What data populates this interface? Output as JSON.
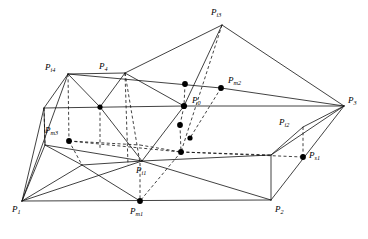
{
  "figure": {
    "type": "geometric-wireframe-diagram",
    "width": 368,
    "height": 239,
    "background_color": "#ffffff",
    "line_color": "#111111",
    "dot_color": "#000000"
  },
  "labels": [
    {
      "id": "P1",
      "base": "P",
      "sub": "1",
      "text": "P1",
      "x": 12,
      "y": 209
    },
    {
      "id": "P2",
      "base": "P",
      "sub": "2",
      "text": "P2",
      "x": 275,
      "y": 209
    },
    {
      "id": "P3",
      "base": "P",
      "sub": "3",
      "text": "P3",
      "x": 348,
      "y": 98
    },
    {
      "id": "P4",
      "base": "P",
      "sub": "4",
      "text": "P4",
      "x": 99,
      "y": 64
    },
    {
      "id": "Pi1",
      "base": "P",
      "sub": "i1",
      "text": "Pi1",
      "x": 136,
      "y": 169
    },
    {
      "id": "Pi2",
      "base": "P",
      "sub": "i2",
      "text": "Pi2",
      "x": 281,
      "y": 120
    },
    {
      "id": "Pi3",
      "base": "P",
      "sub": "i3",
      "text": "Pi3",
      "x": 211,
      "y": 10
    },
    {
      "id": "Pi4",
      "base": "P",
      "sub": "i4",
      "text": "Pi4",
      "x": 47,
      "y": 65
    },
    {
      "id": "Pm1",
      "base": "P",
      "sub": "m1",
      "text": "Pm1",
      "x": 131,
      "y": 211
    },
    {
      "id": "Pm2",
      "base": "P",
      "sub": "m2",
      "text": "Pm2",
      "x": 228,
      "y": 77
    },
    {
      "id": "Pm3",
      "base": "P",
      "sub": "m3",
      "text": "Pm3",
      "x": 46,
      "y": 128
    },
    {
      "id": "Ps1",
      "base": "P",
      "sub": "s1",
      "text": "Ps1",
      "x": 309,
      "y": 152
    },
    {
      "id": "P0",
      "base": "P",
      "sub": "0",
      "text": "P0",
      "x": 192,
      "y": 98
    }
  ],
  "vertices": {
    "P1": {
      "x": 22,
      "y": 201
    },
    "P2": {
      "x": 271,
      "y": 200
    },
    "P3": {
      "x": 344,
      "y": 106
    },
    "P4": {
      "x": 125,
      "y": 73
    },
    "Pi3": {
      "x": 222,
      "y": 25
    },
    "Pi4": {
      "x": 68,
      "y": 74
    },
    "Pi2": {
      "x": 303,
      "y": 127
    },
    "Pi1": {
      "x": 142,
      "y": 161
    },
    "P0": {
      "x": 184,
      "y": 106
    },
    "Pm1": {
      "x": 140,
      "y": 201
    },
    "Pm2": {
      "x": 221,
      "y": 88
    },
    "Pm3": {
      "x": 69,
      "y": 141
    },
    "Ps1": {
      "x": 303,
      "y": 157
    },
    "A": {
      "x": 44,
      "y": 108
    },
    "B": {
      "x": 100,
      "y": 107
    },
    "C": {
      "x": 45,
      "y": 145
    },
    "D": {
      "x": 185,
      "y": 84
    },
    "E": {
      "x": 184,
      "y": 125
    },
    "F": {
      "x": 190,
      "y": 138
    },
    "G": {
      "x": 182,
      "y": 152
    },
    "H": {
      "x": 82,
      "y": 165
    },
    "I": {
      "x": 140,
      "y": 163
    },
    "J": {
      "x": 271,
      "y": 155
    }
  },
  "marker_dots": [
    {
      "name": "dot-at-B",
      "x": 100,
      "y": 107,
      "r": 2.6
    },
    {
      "name": "dot-at-Pm3",
      "x": 69,
      "y": 141,
      "r": 2.9
    },
    {
      "name": "dot-at-Pm2",
      "x": 221,
      "y": 88,
      "r": 2.9
    },
    {
      "name": "dot-at-D",
      "x": 185,
      "y": 84,
      "r": 2.9
    },
    {
      "name": "dot-at-P0",
      "x": 184,
      "y": 106,
      "r": 3.1
    },
    {
      "name": "dot-at-E",
      "x": 180,
      "y": 125,
      "r": 2.9
    },
    {
      "name": "dot-at-F",
      "x": 190,
      "y": 138,
      "r": 2.6
    },
    {
      "name": "dot-at-G",
      "x": 181,
      "y": 152,
      "r": 2.9
    },
    {
      "name": "dot-at-Pm1",
      "x": 140,
      "y": 201,
      "r": 2.9
    },
    {
      "name": "dot-at-Ps1",
      "x": 303,
      "y": 157,
      "r": 2.9
    }
  ],
  "edges_solid": [
    {
      "name": "base-P1-P2",
      "from": "P1",
      "to": "P2"
    },
    {
      "name": "base-P2-P3",
      "from": "P2",
      "to": "P3"
    },
    {
      "name": "base-P1-Pi4",
      "from": "P1",
      "to": "Pi4"
    },
    {
      "name": "base-P1-A",
      "from": "P1",
      "to": "A"
    },
    {
      "name": "base-P1-C",
      "from": "P1",
      "to": "C"
    },
    {
      "name": "base-P1-H",
      "from": "P1",
      "to": "H"
    },
    {
      "name": "base-P1-I",
      "from": "P1",
      "to": "I"
    },
    {
      "name": "top-Pi4-P4",
      "from": "Pi4",
      "to": "P4"
    },
    {
      "name": "top-P4-Pi3",
      "from": "P4",
      "to": "Pi3"
    },
    {
      "name": "top-Pi3-P3",
      "from": "Pi3",
      "to": "P3"
    },
    {
      "name": "top-Pi3-P0",
      "from": "Pi3",
      "to": "P0"
    },
    {
      "name": "ridge-Pi4-Pm2",
      "from": "Pi4",
      "to": "Pm2"
    },
    {
      "name": "ridge-Pm2-P3",
      "from": "Pm2",
      "to": "P3"
    },
    {
      "name": "ridge-A-P0",
      "from": "A",
      "to": "P0"
    },
    {
      "name": "ridge-P0-P3",
      "from": "P0",
      "to": "P3"
    },
    {
      "name": "side-Pi4-A",
      "from": "Pi4",
      "to": "A"
    },
    {
      "name": "side-A-C",
      "from": "A",
      "to": "C"
    },
    {
      "name": "side-C-H",
      "from": "C",
      "to": "H"
    },
    {
      "name": "side-P4-B",
      "from": "P4",
      "to": "B"
    },
    {
      "name": "side-B-I",
      "from": "B",
      "to": "I"
    },
    {
      "name": "mid-C-I",
      "from": "C",
      "to": "I"
    },
    {
      "name": "mid-H-I",
      "from": "H",
      "to": "I"
    },
    {
      "name": "mid-I-P0",
      "from": "I",
      "to": "P0"
    },
    {
      "name": "mid-I-J",
      "from": "I",
      "to": "J"
    },
    {
      "name": "mid-J-P2",
      "from": "J",
      "to": "P2"
    },
    {
      "name": "mid-J-P3",
      "from": "J",
      "to": "P3"
    },
    {
      "name": "mid-J-Pi2",
      "from": "J",
      "to": "Pi2"
    },
    {
      "name": "mid-Pi2-P3",
      "from": "Pi2",
      "to": "P3"
    },
    {
      "name": "face-P4-P0",
      "from": "P4",
      "to": "P0"
    },
    {
      "name": "face-Pi4-B",
      "from": "Pi4",
      "to": "B"
    },
    {
      "name": "lower-H-Pm1",
      "from": "H",
      "to": "Pm1"
    }
  ],
  "edges_dashed": [
    {
      "name": "hid-Pi4-Pm3",
      "from": "Pi4",
      "to": "Pm3"
    },
    {
      "name": "hid-Pm3-H",
      "from": "Pm3",
      "to": "H"
    },
    {
      "name": "hid-Pm3-G",
      "from": "Pm3",
      "to": "G"
    },
    {
      "name": "hid-G-Ps1",
      "from": "G",
      "to": "Ps1"
    },
    {
      "name": "hid-Pi3-P0",
      "from": "Pi3",
      "to": "P0"
    },
    {
      "name": "hid-P0-G",
      "from": "P0",
      "to": "G"
    },
    {
      "name": "hid-G-Pm1",
      "from": "G",
      "to": "Pm1"
    },
    {
      "name": "hid-P4-Pi1",
      "from": "P4",
      "to": "Pi1"
    },
    {
      "name": "hid-Pi1-Pm1",
      "from": "Pi1",
      "to": "Pm1"
    },
    {
      "name": "hid-Pi2-Ps1",
      "from": "Pi2",
      "to": "Ps1"
    },
    {
      "name": "hid-D-P0",
      "from": "D",
      "to": "P0"
    },
    {
      "name": "hid-P0-E",
      "from": "P0",
      "to": "E"
    },
    {
      "name": "hid-E-G",
      "from": "E",
      "to": "G"
    },
    {
      "name": "hid-Pm2-F",
      "from": "Pm2",
      "to": "F"
    },
    {
      "name": "hid-B-vert",
      "from": "B",
      "to": "C"
    },
    {
      "name": "hid-A-left",
      "from": "A",
      "to": "Pm3"
    }
  ]
}
